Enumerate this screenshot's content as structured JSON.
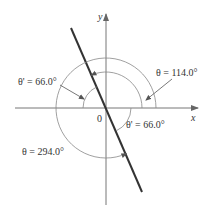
{
  "diagram": {
    "type": "angle-diagram",
    "axes": {
      "x_label": "x",
      "y_label": "y",
      "origin_label": "0"
    },
    "angles": [
      {
        "id": "theta-114",
        "label": "θ = 114.0°",
        "value_deg": 114.0,
        "kind": "standard-position"
      },
      {
        "id": "theta-294",
        "label": "θ = 294.0°",
        "value_deg": 294.0,
        "kind": "standard-position"
      },
      {
        "id": "ref-upper",
        "label": "θ' = 66.0°",
        "value_deg": 66.0,
        "kind": "reference"
      },
      {
        "id": "ref-lower",
        "label": "θ' = 66.0°",
        "value_deg": 66.0,
        "kind": "reference"
      }
    ],
    "colors": {
      "axis": "#777777",
      "terminal_line": "#333333",
      "arc": "#888888",
      "text": "#333333"
    }
  }
}
